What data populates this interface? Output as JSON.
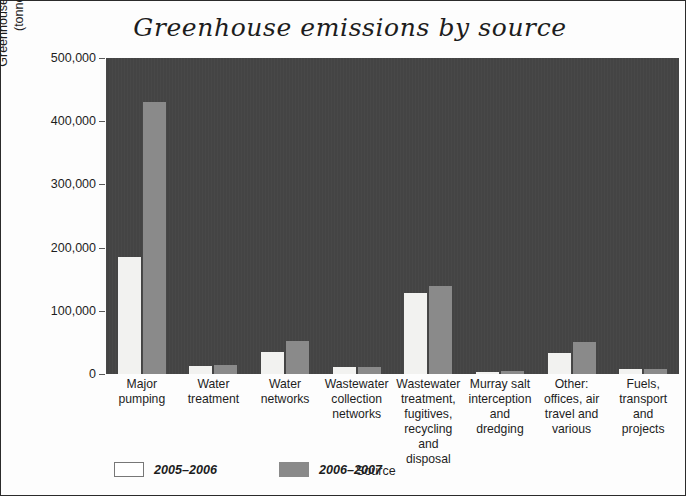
{
  "chart_data": {
    "type": "bar",
    "title": "Greenhouse emissions by source",
    "xlabel": "Source",
    "ylabel": "Greenhouse gas emissions (tonnes CO2e)",
    "ylabel_line1": "Greenhouse gas emissions",
    "ylabel_line2_pre": "(tonnes CO",
    "ylabel_line2_sub": "2",
    "ylabel_line2_post": "e)",
    "ylim": [
      0,
      500000
    ],
    "yticks": [
      0,
      100000,
      200000,
      300000,
      400000,
      500000
    ],
    "ytick_labels": [
      "0",
      "100,000",
      "200,000",
      "300,000",
      "400,000",
      "500,000"
    ],
    "grid": false,
    "legend_position": "bottom-left",
    "plot_background": "#444444",
    "categories": [
      "Major pumping",
      "Water treatment",
      "Water networks",
      "Wastewater collection networks",
      "Wastewater treatment, fugitives, recycling and disposal",
      "Murray salt interception and dredging",
      "Other: offices, air travel and various",
      "Fuels, transport and projects"
    ],
    "category_lines": [
      [
        "Major",
        "pumping"
      ],
      [
        "Water",
        "treatment"
      ],
      [
        "Water",
        "networks"
      ],
      [
        "Wastewater",
        "collection",
        "networks"
      ],
      [
        "Wastewater",
        "treatment,",
        "fugitives,",
        "recycling and",
        "disposal"
      ],
      [
        "Murray salt",
        "interception",
        "and",
        "dredging"
      ],
      [
        "Other:",
        "offices, air",
        "travel and",
        "various"
      ],
      [
        "Fuels,",
        "transport",
        "and",
        "projects"
      ]
    ],
    "series": [
      {
        "name": "2005–2006",
        "color": "#f2f2f0",
        "values": [
          185000,
          13000,
          35000,
          11000,
          128000,
          3000,
          34000,
          8000
        ]
      },
      {
        "name": "2006–2007",
        "color": "#8a8a8a",
        "values": [
          431000,
          15000,
          52000,
          11500,
          140000,
          5500,
          50000,
          8000
        ]
      }
    ]
  },
  "legend": {
    "items": [
      {
        "label": "2005–2006"
      },
      {
        "label": "2006–2007"
      }
    ]
  }
}
